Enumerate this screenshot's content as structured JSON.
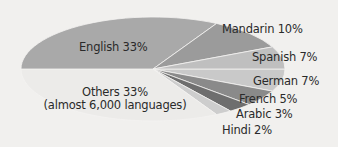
{
  "chart_data": {
    "type": "pie",
    "title": "",
    "slices": [
      {
        "label": "English",
        "value": 33,
        "color": "#a9a9a9",
        "text": "English 33%"
      },
      {
        "label": "Mandarin",
        "value": 10,
        "color": "#9b9b9b",
        "text": "Mandarin 10%"
      },
      {
        "label": "Spanish",
        "value": 7,
        "color": "#bfbfbf",
        "text": "Spanish 7%"
      },
      {
        "label": "German",
        "value": 7,
        "color": "#c9c9c9",
        "text": "German 7%"
      },
      {
        "label": "French",
        "value": 5,
        "color": "#8a8a8a",
        "text": "French 5%"
      },
      {
        "label": "Arabic",
        "value": 3,
        "color": "#6e6e6e",
        "text": "Arabic 3%"
      },
      {
        "label": "Hindi",
        "value": 2,
        "color": "#cdcdcd",
        "text": "Hindi 2%"
      },
      {
        "label": "Others",
        "value": 33,
        "color": "#ecebe9",
        "text": "Others 33%",
        "subtext": "(almost 6,000 languages)"
      }
    ]
  },
  "labels": {
    "english": "English 33%",
    "mandarin": "Mandarin 10%",
    "spanish": "Spanish 7%",
    "german": "German 7%",
    "french": "French 5%",
    "arabic": "Arabic 3%",
    "hindi": "Hindi 2%",
    "others": "Others 33%",
    "others_sub": "(almost 6,000 languages)"
  }
}
